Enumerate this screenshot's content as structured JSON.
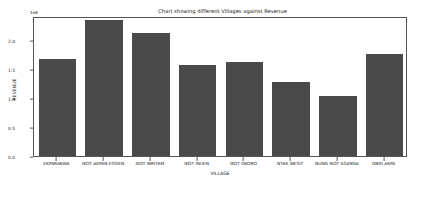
{
  "chart_data": {
    "type": "bar",
    "title": "Chart showing different Villages against Revenue",
    "xlabel": "VILLAGE",
    "ylabel": "REVENUE",
    "y_offset_text": "1e6",
    "categories": [
      "EKPARAKWA",
      "IKOT AKPAN ESSIEN",
      "IKOT IBRITAM",
      "IKOT INUEN",
      "IKOT OKORO",
      "NTAK IBESIT",
      "NUNG IKOT ASANGA",
      "OBIO AKPA"
    ],
    "values": [
      1.67,
      2.35,
      2.12,
      1.57,
      1.63,
      1.28,
      1.03,
      1.77
    ],
    "ylim": [
      0.0,
      2.42
    ],
    "yticks": [
      0.0,
      0.5,
      1.0,
      1.5,
      2.0
    ],
    "ytick_labels": [
      "0.0",
      "0.5",
      "1.0",
      "1.5",
      "2.0"
    ],
    "grid": false,
    "legend": null,
    "bar_color": "#4a4a4a",
    "axis_color": "#555555",
    "background_color": "#ffffff"
  }
}
